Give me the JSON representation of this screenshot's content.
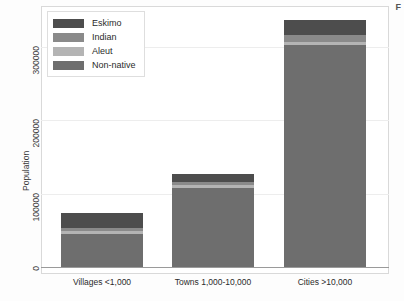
{
  "corner_glyph": "F",
  "legend": {
    "position": "top-left-inside",
    "items": [
      {
        "label": "Eskimo",
        "color": "#4d4d4d"
      },
      {
        "label": "Indian",
        "color": "#8a8a8a"
      },
      {
        "label": "Aleut",
        "color": "#b4b4b4"
      },
      {
        "label": "Non-native",
        "color": "#6e6e6e"
      }
    ]
  },
  "axes": {
    "ylabel": "Population",
    "yticks": [
      "0",
      "100000",
      "200000",
      "300000"
    ],
    "ytick_values": [
      0,
      100000,
      200000,
      300000
    ],
    "ylim": [
      0,
      350000
    ],
    "xlabel": "",
    "grid": true
  },
  "chart_data": {
    "type": "bar",
    "subtype": "stacked",
    "title": "",
    "xlabel": "",
    "ylabel": "Population",
    "ylim": [
      0,
      350000
    ],
    "yticks": [
      0,
      100000,
      200000,
      300000
    ],
    "grid": true,
    "legend_position": "upper left",
    "categories": [
      "Villages <1,000",
      "Towns 1,000-10,000",
      "Cities >10,000"
    ],
    "stack_order_bottom_to_top": [
      "Non-native",
      "Aleut",
      "Indian",
      "Eskimo"
    ],
    "series": [
      {
        "name": "Eskimo",
        "color": "#4d4d4d",
        "values": [
          20000,
          11000,
          21000
        ]
      },
      {
        "name": "Indian",
        "color": "#8a8a8a",
        "values": [
          4000,
          4000,
          9000
        ]
      },
      {
        "name": "Aleut",
        "color": "#b4b4b4",
        "values": [
          4000,
          4000,
          5000
        ]
      },
      {
        "name": "Non-native",
        "color": "#6e6e6e",
        "values": [
          45000,
          108000,
          302000
        ]
      }
    ],
    "totals": [
      73000,
      127000,
      337000
    ]
  },
  "geometry": {
    "plot_left": 41,
    "plot_top": 6,
    "plot_width": 348,
    "plot_height": 268,
    "baseline_y": 267,
    "bar_width": 82,
    "bar_centers_x": [
      102,
      213,
      325
    ]
  }
}
